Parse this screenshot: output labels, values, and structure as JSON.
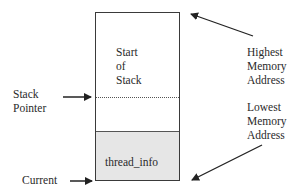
{
  "diagram": {
    "type": "kernel-stack-layout",
    "stack_box": {
      "start_label": [
        "Start",
        "of",
        "Stack"
      ],
      "bottom_region_label": "thread_info",
      "bottom_region_color": "#e6e6e6"
    },
    "labels": {
      "highest": [
        "Highest",
        "Memory",
        "Address"
      ],
      "lowest": [
        "Lowest",
        "Memory",
        "Address"
      ],
      "stack_pointer": [
        "Stack",
        "Pointer"
      ],
      "current": "Current"
    }
  }
}
